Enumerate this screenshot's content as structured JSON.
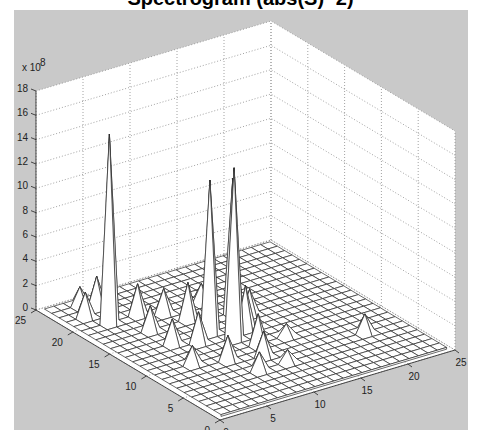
{
  "figure": {
    "title": "Spectrogram (abs(S)^2)",
    "background_color": "#c9c9c9",
    "axes_face_color": "#ffffff",
    "grid_style": "dotted"
  },
  "chart_data": {
    "type": "surface",
    "title": "Spectrogram (abs(S)^2)",
    "xlabel": "",
    "ylabel": "",
    "zlabel": "",
    "z_multiplier_label": "x 10^8",
    "z_multiplier_base": "x 10",
    "z_multiplier_exp": "8",
    "xlim": [
      0,
      25
    ],
    "ylim": [
      0,
      25
    ],
    "zlim": [
      0,
      18
    ],
    "x_ticks": [
      "0",
      "5",
      "10",
      "15",
      "20",
      "25"
    ],
    "y_ticks": [
      "0",
      "5",
      "10",
      "15",
      "20",
      "25"
    ],
    "z_ticks": [
      "0",
      "2",
      "4",
      "6",
      "8",
      "10",
      "12",
      "14",
      "16",
      "18"
    ],
    "grid": true,
    "grid_size": 24,
    "peaks": [
      {
        "x": 3,
        "y": 19,
        "z": 15.5
      },
      {
        "x": 9,
        "y": 13,
        "z": 12.5
      },
      {
        "x": 10,
        "y": 11,
        "z": 14.0
      },
      {
        "x": 13,
        "y": 15,
        "z": 11.0
      },
      {
        "x": 2,
        "y": 21,
        "z": 2.0
      },
      {
        "x": 4,
        "y": 22,
        "z": 2.5
      },
      {
        "x": 3,
        "y": 23,
        "z": 1.5
      },
      {
        "x": 6,
        "y": 19,
        "z": 2.5
      },
      {
        "x": 5,
        "y": 16,
        "z": 2.0
      },
      {
        "x": 8,
        "y": 18,
        "z": 2.0
      },
      {
        "x": 9,
        "y": 16,
        "z": 3.0
      },
      {
        "x": 5,
        "y": 13,
        "z": 2.0
      },
      {
        "x": 7,
        "y": 12,
        "z": 2.5
      },
      {
        "x": 4,
        "y": 9,
        "z": 1.5
      },
      {
        "x": 7,
        "y": 8,
        "z": 2.0
      },
      {
        "x": 10,
        "y": 7,
        "z": 2.0
      },
      {
        "x": 11,
        "y": 9,
        "z": 2.5
      },
      {
        "x": 12,
        "y": 12,
        "z": 3.5
      },
      {
        "x": 14,
        "y": 14,
        "z": 2.0
      },
      {
        "x": 8,
        "y": 5,
        "z": 1.5
      },
      {
        "x": 12,
        "y": 18,
        "z": 1.5
      },
      {
        "x": 14,
        "y": 9,
        "z": 1.0
      },
      {
        "x": 20,
        "y": 6,
        "z": 1.5
      },
      {
        "x": 11,
        "y": 5,
        "z": 1.0
      }
    ]
  }
}
